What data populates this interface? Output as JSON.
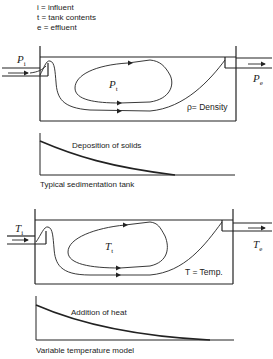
{
  "legend": {
    "lines": [
      "i = influent",
      "t = tank contents",
      "e = effluent"
    ]
  },
  "tank1": {
    "inlet_symbol": "P",
    "inlet_sub": "i",
    "contents_symbol": "P",
    "contents_sub": "t",
    "outlet_symbol": "P",
    "outlet_sub": "e",
    "note": "ρ= Density"
  },
  "graph1": {
    "curve_label": "Deposition of solids",
    "caption": "Typical sedimentation tank"
  },
  "tank2": {
    "inlet_symbol": "T",
    "inlet_sub": "i",
    "contents_symbol": "T",
    "contents_sub": "t",
    "outlet_symbol": "T",
    "outlet_sub": "e",
    "note": "T = Temp."
  },
  "graph2": {
    "curve_label": "Addition of heat",
    "caption": "Variable temperature model"
  },
  "colors": {
    "line": "#222222",
    "background": "#ffffff"
  }
}
